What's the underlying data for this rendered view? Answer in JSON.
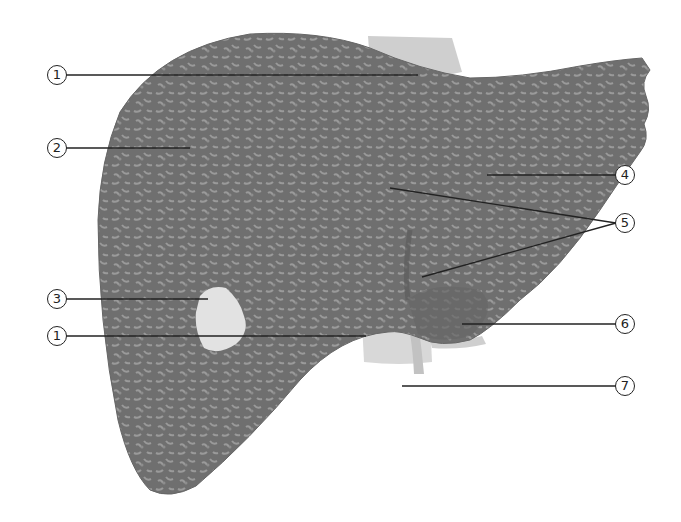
{
  "diagram": {
    "callouts": [
      {
        "id": "c1a",
        "label": "1",
        "x": 57,
        "y": 75,
        "line_to": [
          418,
          75
        ]
      },
      {
        "id": "c2",
        "label": "2",
        "x": 57,
        "y": 148,
        "line_to": [
          190,
          148
        ]
      },
      {
        "id": "c3",
        "label": "3",
        "x": 57,
        "y": 299,
        "line_to": [
          208,
          299
        ]
      },
      {
        "id": "c1b",
        "label": "1",
        "x": 57,
        "y": 336,
        "line_to": [
          366,
          336
        ]
      },
      {
        "id": "c4",
        "label": "4",
        "x": 625,
        "y": 175,
        "line_to": [
          487,
          175
        ]
      },
      {
        "id": "c5",
        "label": "5",
        "x": 625,
        "y": 223,
        "lines_to": [
          [
            390,
            188
          ],
          [
            422,
            277
          ]
        ]
      },
      {
        "id": "c6",
        "label": "6",
        "x": 625,
        "y": 324,
        "line_to": [
          462,
          324
        ]
      },
      {
        "id": "c7",
        "label": "7",
        "x": 625,
        "y": 386,
        "line_to": [
          402,
          386
        ]
      }
    ],
    "colors": {
      "liver": "#6f6f6f",
      "liver_texture": "#9a9a9a",
      "vessel": "#d4d4d4",
      "gallbladder": "#e2e2e2",
      "leader_line": "#222222"
    }
  }
}
